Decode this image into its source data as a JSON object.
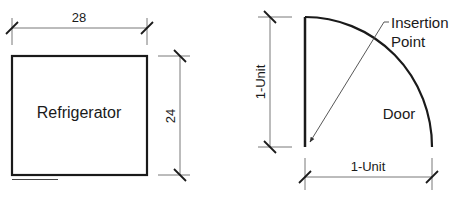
{
  "refrigerator": {
    "label": "Refrigerator",
    "width_dim": "28",
    "depth_dim": "24"
  },
  "door": {
    "label": "Door",
    "vertical_dim": "1-Unit",
    "horizontal_dim": "1-Unit",
    "insertion_line1": "Insertion",
    "insertion_line2": "Point"
  },
  "colors": {
    "stroke": "#1a1a1a",
    "thin": "#555555"
  }
}
